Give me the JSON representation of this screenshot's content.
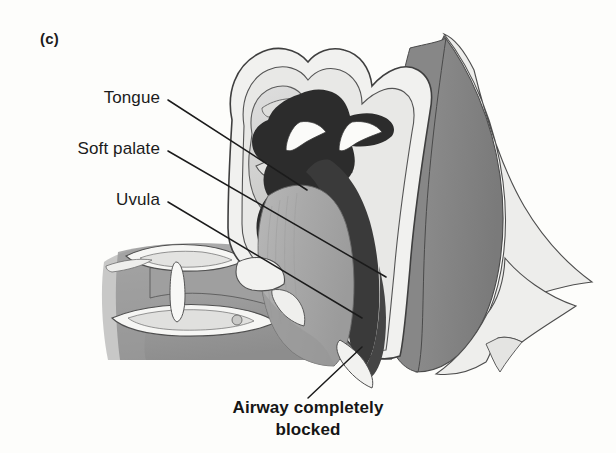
{
  "figure": {
    "panel_label": "(c)",
    "background_color": "#fdfdfb",
    "ink_color": "#1b1b1b",
    "width": 616,
    "height": 453
  },
  "annotations": [
    {
      "id": "tongue",
      "label": "Tongue",
      "label_right_x": 160,
      "label_baseline_y": 104,
      "leader_start": [
        168,
        100
      ],
      "leader_end": [
        307,
        190
      ]
    },
    {
      "id": "soft-palate",
      "label": "Soft palate",
      "label_right_x": 160,
      "label_baseline_y": 155,
      "leader_start": [
        168,
        151
      ],
      "leader_end": [
        386,
        277
      ]
    },
    {
      "id": "uvula",
      "label": "Uvula",
      "label_right_x": 160,
      "label_baseline_y": 206,
      "leader_start": [
        168,
        202
      ],
      "leader_end": [
        362,
        318
      ]
    }
  ],
  "caption": {
    "line1": "Airway completely",
    "line2": "blocked",
    "center_x": 310,
    "line1_baseline_y": 414,
    "line2_baseline_y": 436,
    "leader_start": [
      308,
      398
    ],
    "leader_end": [
      362,
      347
    ]
  },
  "anatomy": {
    "palette": {
      "outline": "#3c3c3c",
      "background": "#fdfdfb",
      "skin_light": "#efefee",
      "cartilage_pale": "#e6e6e4",
      "nasal_cavity": "#d4d4d2",
      "tongue_body": "#a9a9a9",
      "tongue_shadow": "#9a9a9a",
      "pharyngeal_wall": "#8a8a8a",
      "posterior_dark": "#7e7e7e",
      "airway_dark": "#3a3a3a",
      "soft_palate_dark": "#2e2e2e",
      "teeth_white": "#fafafa",
      "bone_light": "#e9e9e7"
    },
    "regions": [
      {
        "name": "nasal-cavity",
        "fill": "#d4d4d2"
      },
      {
        "name": "hard-palate",
        "fill": "#e6e6e4"
      },
      {
        "name": "soft-palate-collapsed",
        "fill": "#2e2e2e"
      },
      {
        "name": "nasal-turbinate-left",
        "fill": "#fafafa"
      },
      {
        "name": "nasal-turbinate-right",
        "fill": "#fafafa"
      },
      {
        "name": "tongue",
        "fill": "#a9a9a9"
      },
      {
        "name": "blocked-airway",
        "fill": "#3a3a3a"
      },
      {
        "name": "pharyngeal-wall",
        "fill": "#8a8a8a"
      },
      {
        "name": "posterior-neck",
        "fill": "#7e7e7e"
      },
      {
        "name": "occipital-bone",
        "fill": "#e9e9e7"
      },
      {
        "name": "mandible",
        "fill": "#9a9a9a"
      },
      {
        "name": "teeth-upper",
        "fill": "#fafafa"
      },
      {
        "name": "teeth-lower",
        "fill": "#fafafa"
      },
      {
        "name": "lips",
        "fill": "#efefee"
      },
      {
        "name": "epiglottis",
        "fill": "#f4f4f2"
      }
    ]
  }
}
